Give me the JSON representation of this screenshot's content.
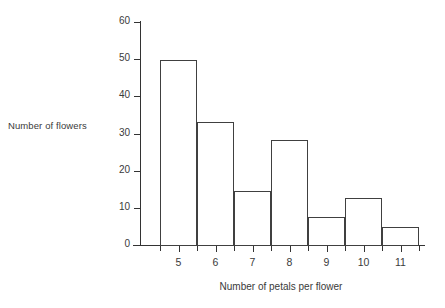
{
  "chart_data": {
    "type": "bar",
    "title": "",
    "xlabel": "Number of petals per flower",
    "ylabel": "Number of flowers",
    "categories": [
      "5",
      "6",
      "7",
      "8",
      "9",
      "10",
      "11"
    ],
    "values": [
      50,
      33.5,
      14.7,
      28.5,
      7.8,
      13,
      5
    ],
    "series": [
      {
        "name": "Number of flowers",
        "values": [
          50,
          33.5,
          14.7,
          28.5,
          7.8,
          13,
          5
        ]
      }
    ],
    "ylim": [
      0,
      60
    ],
    "ytick_labels": [
      "0",
      "10",
      "20",
      "30",
      "40",
      "50",
      "60"
    ],
    "ytick_values": [
      0,
      10,
      20,
      30,
      40,
      50,
      60
    ],
    "grid": false,
    "legend": false,
    "legend_position": "none",
    "bar_style": {
      "fill": "#ffffff",
      "edge": "#404040",
      "adjacent": true
    },
    "axis_color": "#333333"
  }
}
